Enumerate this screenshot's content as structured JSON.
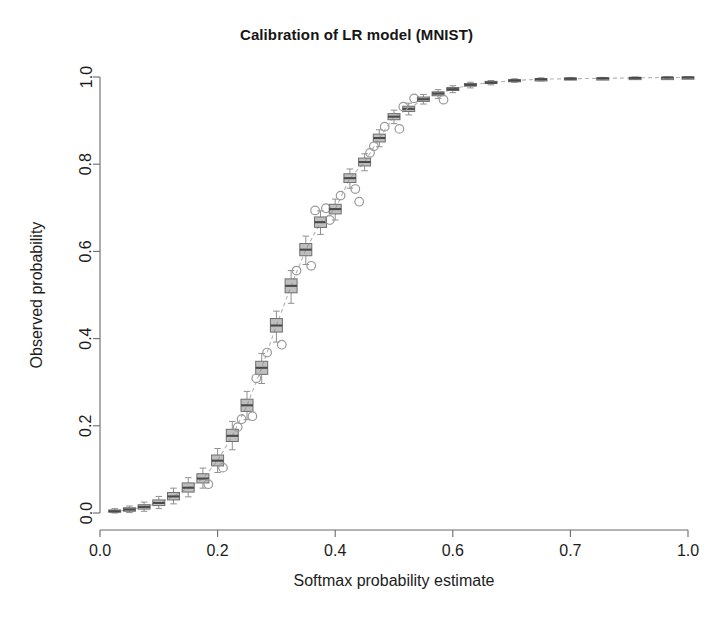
{
  "chart_data": {
    "type": "box",
    "title": "Calibration of LR model (MNIST)",
    "xlabel": "Softmax probability estimate",
    "ylabel": "Observed probability",
    "xlim": [
      0.0,
      1.0
    ],
    "ylim": [
      0.0,
      1.0
    ],
    "grid": false,
    "legend": null,
    "xticks": [
      0.0,
      0.2,
      0.4,
      0.6,
      0.7,
      1.0
    ],
    "xtick_labels": [
      "0.0",
      "0.2",
      "0.4",
      "0.6",
      "0.7",
      "1.0"
    ],
    "xtick_positions": [
      0.0,
      0.2,
      0.4,
      0.6,
      0.8,
      1.0
    ],
    "yticks": [
      0.0,
      0.2,
      0.4,
      0.6,
      0.8,
      1.0
    ],
    "ytick_labels": [
      "0.0",
      "0.2",
      "0.4",
      "0.6",
      "0.8",
      "1.0"
    ],
    "box_fill_color": "#8a8a8a",
    "box_line_color": "#6e6e6e",
    "median_color": "#4a4a4a",
    "whisker_color": "#909090",
    "outlier_color": "#9a9a9a",
    "connector_color": "#b4b4b4",
    "connector_style": "dashed",
    "box_width": 0.016,
    "boxes": [
      {
        "x": 0.025,
        "q1": 0.002,
        "median": 0.004,
        "q3": 0.007,
        "lower": 0.0,
        "upper": 0.01,
        "outliers": []
      },
      {
        "x": 0.05,
        "q1": 0.004,
        "median": 0.008,
        "q3": 0.012,
        "lower": 0.001,
        "upper": 0.016,
        "outliers": []
      },
      {
        "x": 0.075,
        "q1": 0.009,
        "median": 0.014,
        "q3": 0.019,
        "lower": 0.004,
        "upper": 0.025,
        "outliers": []
      },
      {
        "x": 0.1,
        "q1": 0.017,
        "median": 0.023,
        "q3": 0.03,
        "lower": 0.01,
        "upper": 0.038,
        "outliers": []
      },
      {
        "x": 0.125,
        "q1": 0.03,
        "median": 0.038,
        "q3": 0.047,
        "lower": 0.021,
        "upper": 0.057,
        "outliers": []
      },
      {
        "x": 0.15,
        "q1": 0.048,
        "median": 0.058,
        "q3": 0.069,
        "lower": 0.037,
        "upper": 0.081,
        "outliers": []
      },
      {
        "x": 0.175,
        "q1": 0.069,
        "median": 0.079,
        "q3": 0.09,
        "lower": 0.057,
        "upper": 0.103,
        "outliers": [
          0.066
        ]
      },
      {
        "x": 0.2,
        "q1": 0.108,
        "median": 0.12,
        "q3": 0.133,
        "lower": 0.093,
        "upper": 0.148,
        "outliers": [
          0.104
        ]
      },
      {
        "x": 0.225,
        "q1": 0.164,
        "median": 0.177,
        "q3": 0.192,
        "lower": 0.145,
        "upper": 0.21,
        "outliers": [
          0.197
        ]
      },
      {
        "x": 0.25,
        "q1": 0.233,
        "median": 0.247,
        "q3": 0.261,
        "lower": 0.214,
        "upper": 0.279,
        "outliers": [
          0.222,
          0.215
        ]
      },
      {
        "x": 0.275,
        "q1": 0.318,
        "median": 0.333,
        "q3": 0.348,
        "lower": 0.297,
        "upper": 0.366,
        "outliers": [
          0.368,
          0.309
        ]
      },
      {
        "x": 0.3,
        "q1": 0.415,
        "median": 0.43,
        "q3": 0.446,
        "lower": 0.392,
        "upper": 0.463,
        "outliers": [
          0.386
        ]
      },
      {
        "x": 0.325,
        "q1": 0.505,
        "median": 0.521,
        "q3": 0.537,
        "lower": 0.481,
        "upper": 0.556,
        "outliers": [
          0.556
        ]
      },
      {
        "x": 0.35,
        "q1": 0.59,
        "median": 0.604,
        "q3": 0.618,
        "lower": 0.57,
        "upper": 0.635,
        "outliers": [
          0.567
        ]
      },
      {
        "x": 0.375,
        "q1": 0.655,
        "median": 0.667,
        "q3": 0.679,
        "lower": 0.639,
        "upper": 0.693,
        "outliers": [
          0.699,
          0.694
        ]
      },
      {
        "x": 0.4,
        "q1": 0.686,
        "median": 0.697,
        "q3": 0.708,
        "lower": 0.672,
        "upper": 0.72,
        "outliers": [
          0.728,
          0.672
        ]
      },
      {
        "x": 0.425,
        "q1": 0.758,
        "median": 0.768,
        "q3": 0.778,
        "lower": 0.745,
        "upper": 0.789,
        "outliers": [
          0.743
        ]
      },
      {
        "x": 0.45,
        "q1": 0.796,
        "median": 0.805,
        "q3": 0.814,
        "lower": 0.785,
        "upper": 0.824,
        "outliers": [
          0.826,
          0.714
        ]
      },
      {
        "x": 0.475,
        "q1": 0.851,
        "median": 0.86,
        "q3": 0.869,
        "lower": 0.84,
        "upper": 0.879,
        "outliers": [
          0.886,
          0.841
        ]
      },
      {
        "x": 0.5,
        "q1": 0.902,
        "median": 0.909,
        "q3": 0.916,
        "lower": 0.893,
        "upper": 0.924,
        "outliers": [
          0.881
        ]
      },
      {
        "x": 0.525,
        "q1": 0.921,
        "median": 0.927,
        "q3": 0.933,
        "lower": 0.913,
        "upper": 0.94,
        "outliers": [
          0.951,
          0.932
        ]
      },
      {
        "x": 0.55,
        "q1": 0.944,
        "median": 0.949,
        "q3": 0.954,
        "lower": 0.938,
        "upper": 0.96,
        "outliers": []
      },
      {
        "x": 0.575,
        "q1": 0.957,
        "median": 0.962,
        "q3": 0.966,
        "lower": 0.951,
        "upper": 0.971,
        "outliers": [
          0.948
        ]
      },
      {
        "x": 0.6,
        "q1": 0.969,
        "median": 0.972,
        "q3": 0.976,
        "lower": 0.964,
        "upper": 0.98,
        "outliers": []
      },
      {
        "x": 0.63,
        "q1": 0.979,
        "median": 0.982,
        "q3": 0.985,
        "lower": 0.975,
        "upper": 0.988,
        "outliers": []
      },
      {
        "x": 0.665,
        "q1": 0.985,
        "median": 0.987,
        "q3": 0.99,
        "lower": 0.982,
        "upper": 0.992,
        "outliers": []
      },
      {
        "x": 0.705,
        "q1": 0.99,
        "median": 0.992,
        "q3": 0.994,
        "lower": 0.988,
        "upper": 0.996,
        "outliers": []
      },
      {
        "x": 0.75,
        "q1": 0.993,
        "median": 0.995,
        "q3": 0.996,
        "lower": 0.991,
        "upper": 0.998,
        "outliers": []
      },
      {
        "x": 0.8,
        "q1": 0.995,
        "median": 0.996,
        "q3": 0.998,
        "lower": 0.994,
        "upper": 0.999,
        "outliers": []
      },
      {
        "x": 0.855,
        "q1": 0.996,
        "median": 0.997,
        "q3": 0.998,
        "lower": 0.995,
        "upper": 0.999,
        "outliers": []
      },
      {
        "x": 0.91,
        "q1": 0.997,
        "median": 0.998,
        "q3": 0.999,
        "lower": 0.996,
        "upper": 1.0,
        "outliers": []
      },
      {
        "x": 0.965,
        "q1": 0.998,
        "median": 0.999,
        "q3": 0.999,
        "lower": 0.997,
        "upper": 1.0,
        "outliers": []
      },
      {
        "x": 1.0,
        "q1": 0.999,
        "median": 0.999,
        "q3": 1.0,
        "lower": 0.998,
        "upper": 1.0,
        "outliers": []
      }
    ]
  }
}
